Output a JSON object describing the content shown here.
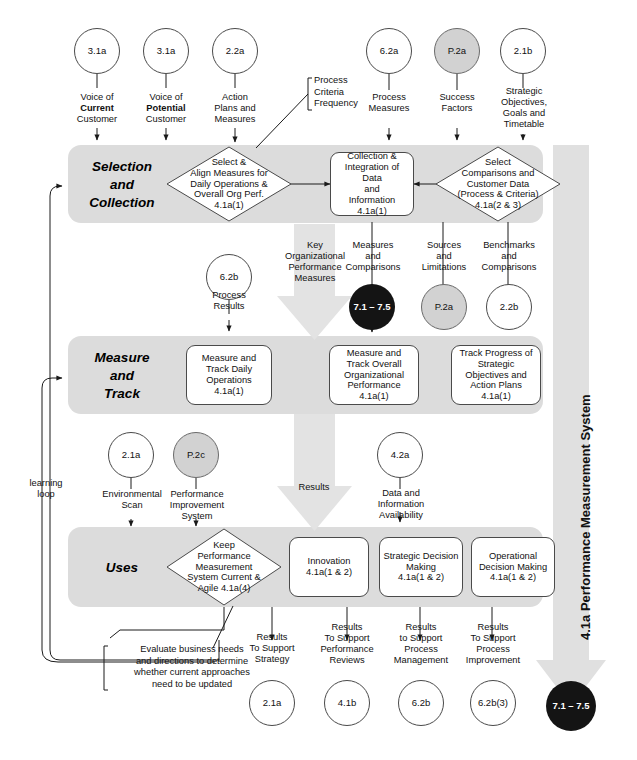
{
  "diagram": {
    "title": "4.1a Performance Measurement System",
    "vertical_system_label": "4.1a  Performance Measurement System",
    "learning_loop_label": "learning\nloop"
  },
  "colors": {
    "band_fill": "#dcdcdc",
    "big_arrow_fill": "#e3e3e3",
    "dark_circle_fill": "#141414",
    "shaded_circle_fill": "#d2d2d2",
    "outline": "#4a4a4a",
    "text": "#111111"
  },
  "top_inputs": [
    {
      "code": "3.1a",
      "shaded": false,
      "label_lines": [
        "Voice of",
        "Current",
        "Customer"
      ],
      "bold_line": 1
    },
    {
      "code": "3.1a",
      "shaded": false,
      "label_lines": [
        "Voice of",
        "Potential",
        "Customer"
      ],
      "bold_line": 1
    },
    {
      "code": "2.2a",
      "shaded": false,
      "label_lines": [
        "Action",
        "Plans and",
        "Measures"
      ],
      "bold_line": -1
    },
    {
      "code": "6.2a",
      "shaded": false,
      "label_lines": [
        "Process",
        "Measures"
      ],
      "bold_line": -1
    },
    {
      "code": "P.2a",
      "shaded": true,
      "label_lines": [
        "Success",
        "Factors"
      ],
      "bold_line": -1
    },
    {
      "code": "2.1b",
      "shaded": false,
      "label_lines": [
        "Strategic",
        "Objectives,",
        "Goals and",
        "Timetable"
      ],
      "bold_line": -1
    }
  ],
  "callouts": {
    "process_criteria": [
      "Process",
      "Criteria",
      "Frequency"
    ],
    "evaluate": [
      "Evaluate business needs",
      "and directions to determine",
      "whether current approaches",
      "need to be updated"
    ]
  },
  "bands": [
    {
      "id": "selection",
      "label_lines": [
        "Selection",
        "and",
        "Collection"
      ]
    },
    {
      "id": "measure",
      "label_lines": [
        "Measure",
        "and",
        "Track"
      ]
    },
    {
      "id": "uses",
      "label_lines": [
        "Uses"
      ]
    }
  ],
  "selection_nodes": [
    {
      "shape": "diamond",
      "name": "select-align-measures",
      "lines": [
        "Select &",
        "Align Measures for",
        "Daily Operations &",
        "Overall Org Perf.",
        "4.1a(1)"
      ]
    },
    {
      "shape": "rbox",
      "name": "collection-integration",
      "lines": [
        "Collection &",
        "Integration of Data",
        "and",
        "Information",
        "4.1a(1)"
      ]
    },
    {
      "shape": "diamond",
      "name": "select-comparisons",
      "lines": [
        "Select",
        "Comparisons and",
        "Customer Data",
        "(Process & Criteria)",
        "4.1a(2 & 3)"
      ]
    }
  ],
  "mid_flow": {
    "big_arrow_label": [
      "Key",
      "Organizational",
      "Performance",
      "Measures"
    ],
    "left_input": {
      "code": "6.2b",
      "shaded": false,
      "label_lines": [
        "Process",
        "Results"
      ]
    },
    "outputs": [
      {
        "code": "7.1 – 7.5",
        "style": "dark",
        "label_lines": [
          "Measures",
          "and",
          "Comparisons"
        ]
      },
      {
        "code": "P.2a",
        "style": "shaded",
        "label_lines": [
          "Sources",
          "and",
          "Limitations"
        ]
      },
      {
        "code": "2.2b",
        "style": "plain",
        "label_lines": [
          "Benchmarks",
          "and",
          "Comparisons"
        ]
      }
    ]
  },
  "measure_nodes": [
    {
      "shape": "rbox",
      "name": "measure-track-daily",
      "lines": [
        "Measure and",
        "Track Daily",
        "Operations",
        "4.1a(1)"
      ]
    },
    {
      "shape": "rbox",
      "name": "measure-track-overall",
      "lines": [
        "Measure and",
        "Track Overall",
        "Organizational",
        "Performance",
        "4.1a(1)"
      ]
    },
    {
      "shape": "rbox",
      "name": "track-progress-strategic",
      "lines": [
        "Track Progress of",
        "Strategic",
        "Objectives and",
        "Action Plans",
        "4.1a(1)"
      ]
    }
  ],
  "mid_flow2": {
    "results_label": "Results",
    "inputs": [
      {
        "code": "2.1a",
        "shaded": false,
        "label_lines": [
          "Environmental",
          "Scan"
        ]
      },
      {
        "code": "P.2c",
        "shaded": true,
        "label_lines": [
          "Performance",
          "Improvement",
          "System"
        ]
      },
      {
        "code": "4.2a",
        "shaded": false,
        "label_lines": [
          "Data and",
          "Information",
          "Availability"
        ]
      }
    ]
  },
  "uses_nodes": [
    {
      "shape": "diamond",
      "name": "keep-pms-current",
      "lines": [
        "Keep",
        "Performance",
        "Measurement",
        "System Current &",
        "Agile 4.1a(4)"
      ]
    },
    {
      "shape": "rbox",
      "name": "innovation",
      "lines": [
        "Innovation",
        "4.1a(1 & 2)"
      ]
    },
    {
      "shape": "rbox",
      "name": "strategic-decision-making",
      "lines": [
        "Strategic Decision",
        "Making",
        "4.1a(1 & 2)"
      ]
    },
    {
      "shape": "rbox",
      "name": "operational-decision-making",
      "lines": [
        "Operational",
        "Decision Making",
        "4.1a(1 & 2)"
      ]
    }
  ],
  "bottom_outputs": [
    {
      "code": "2.1a",
      "style": "plain",
      "label_lines": [
        "Results",
        "To Support",
        "Strategy"
      ]
    },
    {
      "code": "4.1b",
      "style": "plain",
      "label_lines": [
        "Results",
        "To Support",
        "Performance",
        "Reviews"
      ]
    },
    {
      "code": "6.2b",
      "style": "plain",
      "label_lines": [
        "Results",
        "to Support",
        "Process",
        "Management"
      ]
    },
    {
      "code": "6.2b(3)",
      "style": "plain",
      "label_lines": [
        "Results",
        "To Support",
        "Process",
        "Improvement"
      ]
    },
    {
      "code": "7.1 – 7.5",
      "style": "dark",
      "label_lines": []
    }
  ]
}
